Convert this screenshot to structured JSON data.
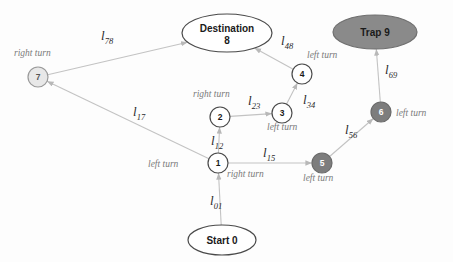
{
  "diagram": {
    "colors": {
      "edge": "#c3c3c3",
      "node_plain_fill": "#ffffff",
      "node_plain_stroke": "#4a4a4a",
      "node_gray_fill": "#e8e8e8",
      "node_gray_stroke": "#9a9a9a",
      "node_dark_fill": "#7d7d7d",
      "node_dark_stroke": "#6a6a6a",
      "trap_fill": "#8a8a8a",
      "trap_stroke": "#6f6f6f",
      "turn_label": "#7a7a7a",
      "edge_label": "#2b2b2b",
      "node_text_dark": "#1a1a1a",
      "node_text_light": "#ffffff"
    },
    "nodes": [
      {
        "id": "start0",
        "label": "Start 0",
        "label2": "",
        "shape": "ellipse",
        "style": "plain",
        "cx": 222,
        "cy": 240,
        "rx": 34,
        "ry": 15
      },
      {
        "id": "destination8",
        "label": "Destination",
        "label2": "8",
        "shape": "ellipse",
        "style": "plain",
        "cx": 227,
        "cy": 33,
        "rx": 45,
        "ry": 19
      },
      {
        "id": "trap9",
        "label": "Trap 9",
        "label2": "",
        "shape": "ellipse",
        "style": "trap",
        "cx": 375,
        "cy": 32,
        "rx": 42,
        "ry": 17
      },
      {
        "id": "n1",
        "label": "1",
        "label2": "",
        "shape": "circle",
        "style": "plain",
        "cx": 218,
        "cy": 163,
        "rx": 10,
        "ry": 10
      },
      {
        "id": "n2",
        "label": "2",
        "label2": "",
        "shape": "circle",
        "style": "plain",
        "cx": 220,
        "cy": 117,
        "rx": 10,
        "ry": 10
      },
      {
        "id": "n3",
        "label": "3",
        "label2": "",
        "shape": "circle",
        "style": "plain",
        "cx": 282,
        "cy": 113,
        "rx": 10,
        "ry": 10
      },
      {
        "id": "n4",
        "label": "4",
        "label2": "",
        "shape": "circle",
        "style": "plain",
        "cx": 302,
        "cy": 74,
        "rx": 10,
        "ry": 10
      },
      {
        "id": "n5",
        "label": "5",
        "label2": "",
        "shape": "circle",
        "style": "dark",
        "cx": 322,
        "cy": 163,
        "rx": 10,
        "ry": 10
      },
      {
        "id": "n6",
        "label": "6",
        "label2": "",
        "shape": "circle",
        "style": "dark",
        "cx": 381,
        "cy": 112,
        "rx": 10,
        "ry": 10
      },
      {
        "id": "n7",
        "label": "7",
        "label2": "",
        "shape": "circle",
        "style": "gray",
        "cx": 38,
        "cy": 77,
        "rx": 10,
        "ry": 10
      }
    ],
    "edges": [
      {
        "id": "e01",
        "from": "start0",
        "to": "n1",
        "label": "l",
        "sub": "01",
        "lx": 210,
        "ly": 205
      },
      {
        "id": "e12",
        "from": "n1",
        "to": "n2",
        "label": "l",
        "sub": "12",
        "lx": 211,
        "ly": 145
      },
      {
        "id": "e23",
        "from": "n2",
        "to": "n3",
        "label": "l",
        "sub": "23",
        "lx": 248,
        "ly": 105
      },
      {
        "id": "e34",
        "from": "n3",
        "to": "n4",
        "label": "l",
        "sub": "34",
        "lx": 303,
        "ly": 104
      },
      {
        "id": "e48",
        "from": "n4",
        "to": "destination8",
        "label": "l",
        "sub": "48",
        "lx": 281,
        "ly": 45
      },
      {
        "id": "e15",
        "from": "n1",
        "to": "n5",
        "label": "l",
        "sub": "15",
        "lx": 263,
        "ly": 157
      },
      {
        "id": "e56",
        "from": "n5",
        "to": "n6",
        "label": "l",
        "sub": "56",
        "lx": 345,
        "ly": 134
      },
      {
        "id": "e69",
        "from": "n6",
        "to": "trap9",
        "label": "l",
        "sub": "69",
        "lx": 385,
        "ly": 74
      },
      {
        "id": "e17",
        "from": "n1",
        "to": "n7",
        "label": "l",
        "sub": "17",
        "lx": 133,
        "ly": 116
      },
      {
        "id": "e78",
        "from": "n7",
        "to": "destination8",
        "label": "l",
        "sub": "78",
        "lx": 101,
        "ly": 40
      }
    ],
    "turn_labels": [
      {
        "id": "t-right-7",
        "text": "right turn",
        "x": 14,
        "y": 56,
        "anchor": "start"
      },
      {
        "id": "t-right-2",
        "text": "right turn",
        "x": 193,
        "y": 97,
        "anchor": "start"
      },
      {
        "id": "t-left-3",
        "text": "left turn",
        "x": 267,
        "y": 130,
        "anchor": "start"
      },
      {
        "id": "t-left-4",
        "text": "left turn",
        "x": 307,
        "y": 58,
        "anchor": "start"
      },
      {
        "id": "t-left-1",
        "text": "left turn",
        "x": 148,
        "y": 167,
        "anchor": "start"
      },
      {
        "id": "t-right-1",
        "text": "right turn",
        "x": 227,
        "y": 177,
        "anchor": "start"
      },
      {
        "id": "t-left-5",
        "text": "left turn",
        "x": 303,
        "y": 181,
        "anchor": "start"
      },
      {
        "id": "t-left-6",
        "text": "left turn",
        "x": 396,
        "y": 116,
        "anchor": "start"
      }
    ]
  }
}
